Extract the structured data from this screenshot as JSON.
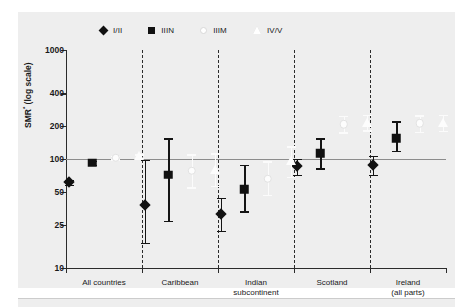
{
  "chart_data": {
    "type": "scatter",
    "title": "",
    "xlabel": "",
    "ylabel": "SMR (log scale)",
    "ylabel_sup": "*",
    "yscale": "log",
    "ylim": [
      10,
      1000
    ],
    "yticks": [
      1000,
      400,
      200,
      100,
      50,
      25,
      10
    ],
    "ytick_labels": [
      "1000",
      "400",
      "200",
      "100",
      "50",
      "25",
      "10"
    ],
    "reference_line": 100,
    "grid": false,
    "legend_position": "top",
    "categories": [
      "All countries",
      "Caribbean",
      "Indian subcontinent",
      "Scotland",
      "Ireland (all parts)"
    ],
    "category_label_lines": [
      [
        "All countries"
      ],
      [
        "Caribbean"
      ],
      [
        "Indian",
        "subcontinent"
      ],
      [
        "Scotland"
      ],
      [
        "Ireland",
        "(all parts)"
      ]
    ],
    "series": [
      {
        "name": "I/II",
        "marker": "diamond",
        "fill": "#111111",
        "values": [
          61,
          38,
          31,
          86,
          88
        ],
        "ci_low": [
          58,
          17,
          22,
          72,
          72
        ],
        "ci_high": [
          64,
          98,
          44,
          101,
          107
        ]
      },
      {
        "name": "IIIN",
        "marker": "square",
        "fill": "#111111",
        "values": [
          92,
          72,
          53,
          113,
          155
        ],
        "ci_low": [
          88,
          27,
          33,
          82,
          118
        ],
        "ci_high": [
          96,
          155,
          88,
          155,
          222
        ]
      },
      {
        "name": "IIIM",
        "marker": "circle",
        "fill": "#ffffff",
        "values": [
          103,
          78,
          66,
          209,
          212
        ],
        "ci_low": [
          99,
          55,
          47,
          176,
          178
        ],
        "ci_high": [
          107,
          110,
          95,
          248,
          252
        ]
      },
      {
        "name": "IV/V",
        "marker": "triangle",
        "fill": "#ffffff",
        "values": [
          106,
          80,
          95,
          216,
          214
        ],
        "ci_low": [
          102,
          57,
          69,
          183,
          180
        ],
        "ci_high": [
          110,
          113,
          131,
          255,
          254
        ]
      }
    ]
  },
  "legend": {
    "items": [
      {
        "label": "I/II",
        "marker": "diamond"
      },
      {
        "label": "IIIN",
        "marker": "square"
      },
      {
        "label": "IIIM",
        "marker": "circle"
      },
      {
        "label": "IV/V",
        "marker": "triangle"
      }
    ]
  },
  "axis": {
    "y_title": "SMR",
    "y_title_suffix": " (log scale)",
    "y_title_marker": "*"
  },
  "colors": {
    "panel_background": "#eeeeee",
    "axis": "#2b2b2b",
    "reference_line": "#8c8c8c",
    "dark_marker": "#111111",
    "light_marker": "#ffffff"
  }
}
